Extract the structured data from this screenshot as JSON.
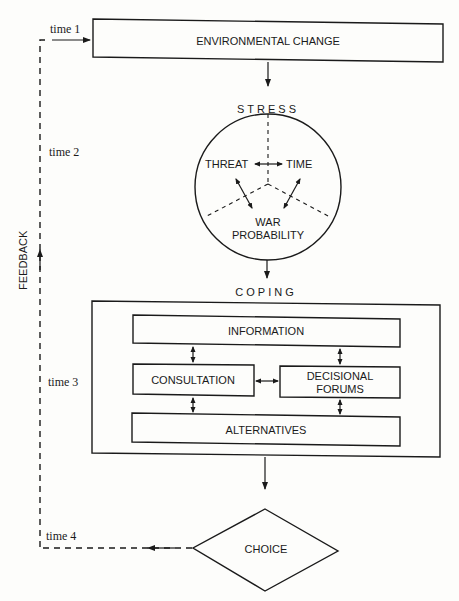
{
  "diagram": {
    "nodes": {
      "environmental_change": "ENVIRONMENTAL CHANGE",
      "stress": "STRESS",
      "threat": "THREAT",
      "time": "TIME",
      "war_probability_1": "WAR",
      "war_probability_2": "PROBABILITY",
      "coping": "COPING",
      "information": "INFORMATION",
      "consultation": "CONSULTATION",
      "decisional_forums_1": "DECISIONAL",
      "decisional_forums_2": "FORUMS",
      "alternatives": "ALTERNATIVES",
      "choice": "CHOICE"
    },
    "time_labels": [
      "time 1",
      "time 2",
      "time 3",
      "time 4"
    ],
    "feedback_label": "FEEDBACK",
    "edges": [
      {
        "from": "ENVIRONMENTAL CHANGE",
        "to": "STRESS",
        "style": "solid"
      },
      {
        "from": "STRESS",
        "to": "COPING",
        "style": "solid"
      },
      {
        "from": "COPING",
        "to": "CHOICE",
        "style": "solid"
      },
      {
        "from": "CHOICE",
        "to": "ENVIRONMENTAL CHANGE",
        "style": "dashed",
        "label": "FEEDBACK"
      },
      {
        "from": "THREAT",
        "to": "TIME",
        "style": "bidirectional"
      },
      {
        "from": "THREAT",
        "to": "WAR PROBABILITY",
        "style": "bidirectional"
      },
      {
        "from": "TIME",
        "to": "WAR PROBABILITY",
        "style": "bidirectional"
      },
      {
        "from": "INFORMATION",
        "to": "CONSULTATION",
        "style": "bidirectional"
      },
      {
        "from": "INFORMATION",
        "to": "DECISIONAL FORUMS",
        "style": "bidirectional"
      },
      {
        "from": "CONSULTATION",
        "to": "DECISIONAL FORUMS",
        "style": "bidirectional"
      },
      {
        "from": "CONSULTATION",
        "to": "ALTERNATIVES",
        "style": "bidirectional"
      },
      {
        "from": "DECISIONAL FORUMS",
        "to": "ALTERNATIVES",
        "style": "bidirectional"
      }
    ]
  }
}
